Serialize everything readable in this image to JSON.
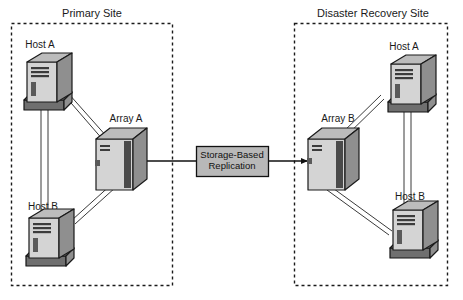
{
  "diagram": {
    "sites": [
      {
        "id": "primary",
        "label": "Primary Site",
        "nodes": [
          {
            "id": "primary-host-a",
            "label": "Host A",
            "type": "server-tower"
          },
          {
            "id": "primary-host-b",
            "label": "Host B",
            "type": "server-tower"
          },
          {
            "id": "primary-array",
            "label": "Array A",
            "type": "storage-array"
          }
        ]
      },
      {
        "id": "dr",
        "label": "Disaster Recovery Site",
        "nodes": [
          {
            "id": "dr-host-a",
            "label": "Host A",
            "type": "server-tower"
          },
          {
            "id": "dr-host-b",
            "label": "Host B",
            "type": "server-tower"
          },
          {
            "id": "dr-array",
            "label": "Array B",
            "type": "storage-array"
          }
        ]
      }
    ],
    "replication": {
      "label_line1": "Storage-Based",
      "label_line2": "Replication",
      "direction": "primary-to-dr"
    },
    "colors": {
      "site_border": "#1a1a1a",
      "node_front": "#d4d4d4",
      "node_side": "#8f8f8f",
      "node_top": "#bcbcbc",
      "replication_fill": "#b8b8b8",
      "link": "#3a3a3a",
      "text": "#1a1a1a",
      "background": "#ffffff"
    }
  }
}
